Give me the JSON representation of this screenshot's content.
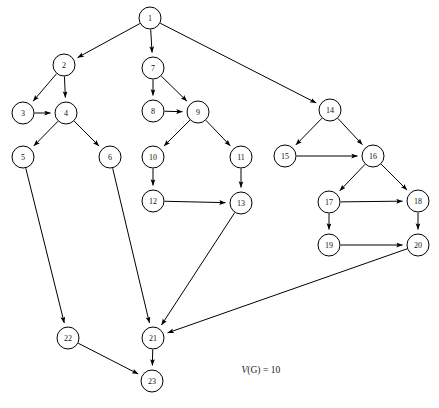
{
  "figure": {
    "type": "directed-graph",
    "background_color": "#ffffff",
    "stroke_color": "#000000",
    "node_fill_color": "#ffffff",
    "width": 439,
    "height": 408,
    "node_radius": 11
  },
  "caption": {
    "metric_symbol": "V",
    "metric_arg": "(G)",
    "equals": " = ",
    "value": "10",
    "full_text": "V(G) = 10",
    "x": 232,
    "y": 355
  },
  "chart_data": {
    "type": "diagram",
    "node_count": 23,
    "edge_count": 30,
    "nodes": [
      {
        "id": "1",
        "label": "1",
        "x": 150,
        "y": 18
      },
      {
        "id": "2",
        "label": "2",
        "x": 64,
        "y": 65
      },
      {
        "id": "3",
        "label": "3",
        "x": 23,
        "y": 113
      },
      {
        "id": "4",
        "label": "4",
        "x": 66,
        "y": 113
      },
      {
        "id": "5",
        "label": "5",
        "x": 23,
        "y": 157
      },
      {
        "id": "6",
        "label": "6",
        "x": 110,
        "y": 157
      },
      {
        "id": "7",
        "label": "7",
        "x": 153,
        "y": 68
      },
      {
        "id": "8",
        "label": "8",
        "x": 153,
        "y": 111
      },
      {
        "id": "9",
        "label": "9",
        "x": 198,
        "y": 112
      },
      {
        "id": "10",
        "label": "10",
        "x": 153,
        "y": 157
      },
      {
        "id": "11",
        "label": "11",
        "x": 241,
        "y": 157
      },
      {
        "id": "12",
        "label": "12",
        "x": 153,
        "y": 201
      },
      {
        "id": "13",
        "label": "13",
        "x": 241,
        "y": 203
      },
      {
        "id": "14",
        "label": "14",
        "x": 330,
        "y": 110
      },
      {
        "id": "15",
        "label": "15",
        "x": 285,
        "y": 156
      },
      {
        "id": "16",
        "label": "16",
        "x": 373,
        "y": 156
      },
      {
        "id": "17",
        "label": "17",
        "x": 329,
        "y": 202
      },
      {
        "id": "18",
        "label": "18",
        "x": 418,
        "y": 201
      },
      {
        "id": "19",
        "label": "19",
        "x": 329,
        "y": 245
      },
      {
        "id": "20",
        "label": "20",
        "x": 418,
        "y": 245
      },
      {
        "id": "21",
        "label": "21",
        "x": 153,
        "y": 338
      },
      {
        "id": "22",
        "label": "22",
        "x": 68,
        "y": 338
      },
      {
        "id": "23",
        "label": "23",
        "x": 152,
        "y": 381
      }
    ],
    "edges": [
      {
        "from": "1",
        "to": "2"
      },
      {
        "from": "1",
        "to": "7"
      },
      {
        "from": "1",
        "to": "14"
      },
      {
        "from": "2",
        "to": "3"
      },
      {
        "from": "2",
        "to": "4"
      },
      {
        "from": "3",
        "to": "4"
      },
      {
        "from": "4",
        "to": "5"
      },
      {
        "from": "4",
        "to": "6"
      },
      {
        "from": "5",
        "to": "22"
      },
      {
        "from": "6",
        "to": "21"
      },
      {
        "from": "7",
        "to": "8"
      },
      {
        "from": "7",
        "to": "9"
      },
      {
        "from": "8",
        "to": "9"
      },
      {
        "from": "9",
        "to": "10"
      },
      {
        "from": "9",
        "to": "11"
      },
      {
        "from": "10",
        "to": "12"
      },
      {
        "from": "11",
        "to": "13"
      },
      {
        "from": "12",
        "to": "13"
      },
      {
        "from": "13",
        "to": "21"
      },
      {
        "from": "14",
        "to": "15"
      },
      {
        "from": "14",
        "to": "16"
      },
      {
        "from": "15",
        "to": "16"
      },
      {
        "from": "16",
        "to": "17"
      },
      {
        "from": "16",
        "to": "18"
      },
      {
        "from": "17",
        "to": "18"
      },
      {
        "from": "17",
        "to": "19"
      },
      {
        "from": "18",
        "to": "20"
      },
      {
        "from": "19",
        "to": "20"
      },
      {
        "from": "20",
        "to": "21"
      },
      {
        "from": "21",
        "to": "23"
      },
      {
        "from": "22",
        "to": "23"
      }
    ]
  }
}
